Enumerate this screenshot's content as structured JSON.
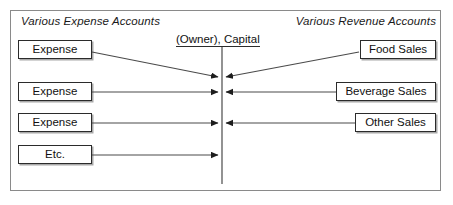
{
  "diagram": {
    "headers": {
      "left": "Various Expense Accounts",
      "right": "Various Revenue Accounts"
    },
    "center": {
      "label": "(Owner), Capital",
      "underlined": true
    },
    "left_accounts": [
      {
        "label": "Expense"
      },
      {
        "label": "Expense"
      },
      {
        "label": "Expense"
      },
      {
        "label": "Etc."
      }
    ],
    "right_accounts": [
      {
        "label": "Food Sales"
      },
      {
        "label": "Beverage Sales"
      },
      {
        "label": "Other Sales"
      }
    ],
    "colors": {
      "frame_border": "#8a8a8a",
      "box_border": "#2b2b2b",
      "line": "#4a4a4a",
      "text": "#111111",
      "background": "#ffffff"
    },
    "flows": [
      {
        "from": "Expense",
        "to": "(Owner), Capital",
        "direction": "right",
        "style": "diagonal"
      },
      {
        "from": "Food Sales",
        "to": "(Owner), Capital",
        "direction": "left",
        "style": "diagonal"
      },
      {
        "from": "Expense",
        "to": "(Owner), Capital",
        "direction": "right",
        "style": "straight"
      },
      {
        "from": "Beverage Sales",
        "to": "(Owner), Capital",
        "direction": "left",
        "style": "straight"
      },
      {
        "from": "Expense",
        "to": "(Owner), Capital",
        "direction": "right",
        "style": "straight"
      },
      {
        "from": "Other Sales",
        "to": "(Owner), Capital",
        "direction": "left",
        "style": "straight"
      },
      {
        "from": "Etc.",
        "to": "(Owner), Capital",
        "direction": "right",
        "style": "straight"
      }
    ]
  }
}
